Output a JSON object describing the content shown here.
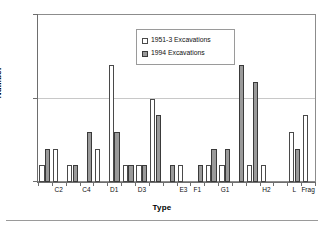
{
  "chart_data": {
    "type": "bar",
    "title": "",
    "xlabel": "Type",
    "ylabel": "Number",
    "ylim": [
      0,
      10
    ],
    "yticks": [
      0,
      5,
      10
    ],
    "ytick_labels": [
      "0",
      "5",
      "10"
    ],
    "grid": "horizontal gridlines at 5 and 10",
    "legend_position": "upper center inside plot",
    "categories": [
      "C1",
      "C2",
      "C3",
      "C4",
      "C5",
      "D1",
      "D2",
      "D3",
      "E1",
      "E2",
      "E3",
      "F1",
      "F2",
      "G1",
      "G2",
      "H1",
      "H2",
      "H3",
      "L",
      "Frag"
    ],
    "category_tick_labels": [
      "",
      "C2",
      "",
      "C4",
      "",
      "D1",
      "",
      "D3",
      "",
      "",
      "E3",
      "F1",
      "",
      "G1",
      "",
      "",
      "H2",
      "",
      "L",
      "Frag"
    ],
    "series": [
      {
        "name": "1951-3 Excavations",
        "color": "#ffffff",
        "edge_color": "#4a4a4a",
        "values": [
          1,
          2,
          1,
          0,
          2,
          7,
          1,
          1,
          5,
          0,
          1,
          0,
          1,
          1,
          0,
          1,
          1,
          0,
          3,
          4
        ]
      },
      {
        "name": "1994 Excavations",
        "color": "#9a9a9a",
        "edge_color": "#3a3a3a",
        "values": [
          2,
          0,
          1,
          3,
          0,
          3,
          1,
          1,
          4,
          1,
          0,
          1,
          2,
          2,
          7,
          6,
          0,
          0,
          2,
          0
        ]
      }
    ]
  },
  "legend": {
    "items": [
      {
        "label": "1951-3 Excavations"
      },
      {
        "label": "1994 Excavations"
      }
    ]
  },
  "axes": {
    "y_label": "Number",
    "x_label": "Type",
    "y_tick_0": "0",
    "y_tick_5": "5",
    "y_tick_10": "10"
  }
}
